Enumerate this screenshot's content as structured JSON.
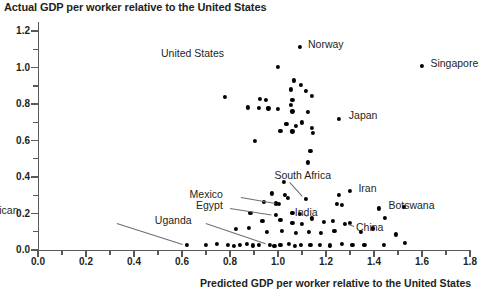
{
  "chart_data": {
    "type": "scatter",
    "title": "Actual GDP per worker relative to the United States",
    "xlabel": "Predicted GDP per worker relative to the United States",
    "ylabel": "Actual GDP per worker relative to the United States",
    "xlim": [
      0.0,
      1.8
    ],
    "ylim": [
      0.0,
      1.25
    ],
    "xticks": [
      "0.0",
      "0.2",
      "0.4",
      "0.6",
      "0.8",
      "1.0",
      "1.2",
      "1.4",
      "1.6",
      "1.8"
    ],
    "xtick_values": [
      0.0,
      0.2,
      0.4,
      0.6,
      0.8,
      1.0,
      1.2,
      1.4,
      1.6,
      1.8
    ],
    "yticks": [
      "0.0",
      "0.2",
      "0.4",
      "0.6",
      "0.8",
      "1.0",
      "1.2"
    ],
    "ytick_values": [
      0.0,
      0.2,
      0.4,
      0.6,
      0.8,
      1.0,
      1.2
    ],
    "minor_tick_step": 0.1,
    "grid": false,
    "legend": null,
    "annotations": [
      {
        "text": "Norway",
        "x": 1.09,
        "y": 1.115,
        "lx": 1.125,
        "ly": 1.125,
        "leader": false
      },
      {
        "text": "United States",
        "x": 1.0,
        "y": 1.005,
        "lx": 0.775,
        "ly": 1.075,
        "leader": false
      },
      {
        "text": "Singapore",
        "x": 1.6,
        "y": 1.01,
        "lx": 1.635,
        "ly": 1.02,
        "leader": false
      },
      {
        "text": "Japan",
        "x": 1.255,
        "y": 0.72,
        "lx": 1.295,
        "ly": 0.735,
        "leader": false
      },
      {
        "text": "South Africa",
        "x": 1.115,
        "y": 0.28,
        "lx": 0.985,
        "ly": 0.405,
        "leader": true
      },
      {
        "text": "Iran",
        "x": 1.3,
        "y": 0.322,
        "lx": 1.335,
        "ly": 0.335,
        "leader": false
      },
      {
        "text": "Mexico",
        "x": 1.005,
        "y": 0.252,
        "lx": 0.77,
        "ly": 0.3,
        "leader": true
      },
      {
        "text": "Egypt",
        "x": 0.99,
        "y": 0.193,
        "lx": 0.77,
        "ly": 0.243,
        "leader": true
      },
      {
        "text": "India",
        "x": 1.14,
        "y": 0.173,
        "lx": 1.07,
        "ly": 0.205,
        "leader": true
      },
      {
        "text": "Botswana",
        "x": 1.42,
        "y": 0.228,
        "lx": 1.46,
        "ly": 0.242,
        "leader": false
      },
      {
        "text": "China",
        "x": 1.28,
        "y": 0.145,
        "lx": 1.325,
        "ly": 0.118,
        "leader": true
      },
      {
        "text": "Uganda",
        "x": 0.965,
        "y": 0.03,
        "lx": 0.64,
        "ly": 0.16,
        "leader": true
      },
      {
        "text": "Central African Republic",
        "x": 0.62,
        "y": 0.028,
        "lx": 0.215,
        "ly": 0.175,
        "leader": true
      }
    ],
    "points": [
      {
        "x": 1.09,
        "y": 1.115
      },
      {
        "x": 1.6,
        "y": 1.01
      },
      {
        "x": 1.0,
        "y": 1.005
      },
      {
        "x": 1.065,
        "y": 0.93
      },
      {
        "x": 1.095,
        "y": 0.905
      },
      {
        "x": 1.055,
        "y": 0.88
      },
      {
        "x": 1.115,
        "y": 0.87
      },
      {
        "x": 1.14,
        "y": 0.845
      },
      {
        "x": 0.78,
        "y": 0.84
      },
      {
        "x": 0.925,
        "y": 0.83
      },
      {
        "x": 0.95,
        "y": 0.825
      },
      {
        "x": 1.06,
        "y": 0.822
      },
      {
        "x": 1.055,
        "y": 0.795
      },
      {
        "x": 0.875,
        "y": 0.782
      },
      {
        "x": 0.92,
        "y": 0.778
      },
      {
        "x": 0.96,
        "y": 0.776
      },
      {
        "x": 1.0,
        "y": 0.772
      },
      {
        "x": 1.06,
        "y": 0.76
      },
      {
        "x": 1.125,
        "y": 0.758
      },
      {
        "x": 1.255,
        "y": 0.72
      },
      {
        "x": 1.1,
        "y": 0.7
      },
      {
        "x": 1.035,
        "y": 0.69
      },
      {
        "x": 1.075,
        "y": 0.68
      },
      {
        "x": 1.14,
        "y": 0.67
      },
      {
        "x": 1.01,
        "y": 0.655
      },
      {
        "x": 1.06,
        "y": 0.65
      },
      {
        "x": 1.145,
        "y": 0.64
      },
      {
        "x": 0.905,
        "y": 0.6
      },
      {
        "x": 1.135,
        "y": 0.545
      },
      {
        "x": 1.125,
        "y": 0.48
      },
      {
        "x": 1.115,
        "y": 0.28
      },
      {
        "x": 1.3,
        "y": 0.322
      },
      {
        "x": 1.025,
        "y": 0.372
      },
      {
        "x": 1.255,
        "y": 0.3
      },
      {
        "x": 1.005,
        "y": 0.252
      },
      {
        "x": 0.975,
        "y": 0.31
      },
      {
        "x": 1.03,
        "y": 0.3
      },
      {
        "x": 1.04,
        "y": 0.285
      },
      {
        "x": 0.94,
        "y": 0.262
      },
      {
        "x": 0.99,
        "y": 0.255
      },
      {
        "x": 1.245,
        "y": 0.252
      },
      {
        "x": 1.265,
        "y": 0.245
      },
      {
        "x": 1.42,
        "y": 0.228
      },
      {
        "x": 0.99,
        "y": 0.193
      },
      {
        "x": 1.06,
        "y": 0.205
      },
      {
        "x": 1.09,
        "y": 0.2
      },
      {
        "x": 1.14,
        "y": 0.173
      },
      {
        "x": 1.445,
        "y": 0.178
      },
      {
        "x": 1.525,
        "y": 0.235
      },
      {
        "x": 0.885,
        "y": 0.205
      },
      {
        "x": 0.935,
        "y": 0.16
      },
      {
        "x": 1.01,
        "y": 0.165
      },
      {
        "x": 1.06,
        "y": 0.15
      },
      {
        "x": 1.1,
        "y": 0.145
      },
      {
        "x": 1.19,
        "y": 0.152
      },
      {
        "x": 1.23,
        "y": 0.16
      },
      {
        "x": 1.28,
        "y": 0.145
      },
      {
        "x": 1.3,
        "y": 0.15
      },
      {
        "x": 0.825,
        "y": 0.115
      },
      {
        "x": 0.88,
        "y": 0.12
      },
      {
        "x": 0.955,
        "y": 0.1
      },
      {
        "x": 1.015,
        "y": 0.105
      },
      {
        "x": 1.075,
        "y": 0.095
      },
      {
        "x": 1.13,
        "y": 0.1
      },
      {
        "x": 1.18,
        "y": 0.095
      },
      {
        "x": 1.235,
        "y": 0.105
      },
      {
        "x": 1.345,
        "y": 0.1
      },
      {
        "x": 1.395,
        "y": 0.118
      },
      {
        "x": 1.49,
        "y": 0.085
      },
      {
        "x": 0.62,
        "y": 0.028
      },
      {
        "x": 0.7,
        "y": 0.03
      },
      {
        "x": 0.745,
        "y": 0.032
      },
      {
        "x": 0.79,
        "y": 0.028
      },
      {
        "x": 0.815,
        "y": 0.022
      },
      {
        "x": 0.84,
        "y": 0.03
      },
      {
        "x": 0.87,
        "y": 0.035
      },
      {
        "x": 0.895,
        "y": 0.025
      },
      {
        "x": 0.92,
        "y": 0.03
      },
      {
        "x": 0.965,
        "y": 0.03
      },
      {
        "x": 0.985,
        "y": 0.022
      },
      {
        "x": 1.01,
        "y": 0.028
      },
      {
        "x": 1.045,
        "y": 0.032
      },
      {
        "x": 1.07,
        "y": 0.024
      },
      {
        "x": 1.095,
        "y": 0.03
      },
      {
        "x": 1.135,
        "y": 0.026
      },
      {
        "x": 1.175,
        "y": 0.03
      },
      {
        "x": 1.215,
        "y": 0.025
      },
      {
        "x": 1.265,
        "y": 0.032
      },
      {
        "x": 1.31,
        "y": 0.028
      },
      {
        "x": 1.36,
        "y": 0.03
      },
      {
        "x": 1.44,
        "y": 0.028
      },
      {
        "x": 1.53,
        "y": 0.038
      }
    ]
  }
}
